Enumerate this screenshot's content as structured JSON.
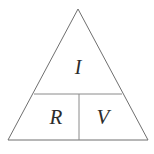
{
  "figure": {
    "name": "ohms-law-triangle",
    "background_color": "#ffffff",
    "outline_color": "#6f6f6f",
    "divider_color": "#8a8a8a",
    "label_color": "#2c2c2c",
    "width": 154,
    "height": 154
  },
  "triangle": {
    "apex": {
      "x": 78,
      "y": 9
    },
    "base_left": {
      "x": 8,
      "y": 140
    },
    "base_right": {
      "x": 148,
      "y": 140
    }
  },
  "dividers": {
    "horizontal": {
      "x1": 34,
      "y1": 94,
      "x2": 122,
      "y2": 94
    },
    "vertical": {
      "x1": 79,
      "y1": 94,
      "x2": 79,
      "y2": 140
    }
  },
  "cells": {
    "top": {
      "label": "I",
      "x": 78,
      "y": 68
    },
    "bottom_left": {
      "label": "R",
      "x": 56,
      "y": 118
    },
    "bottom_right": {
      "label": "V",
      "x": 103,
      "y": 118
    }
  }
}
